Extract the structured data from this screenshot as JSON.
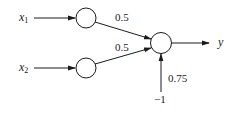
{
  "diagram": {
    "type": "perceptron",
    "inputs": [
      {
        "id": "x1",
        "label": "x",
        "subscript": "1"
      },
      {
        "id": "x2",
        "label": "x",
        "subscript": "2"
      }
    ],
    "weights": [
      {
        "from": "x1",
        "to": "output",
        "value": "0.5"
      },
      {
        "from": "x2",
        "to": "output",
        "value": "0.5"
      }
    ],
    "bias": {
      "input_value": "−1",
      "weight": "0.75"
    },
    "output": {
      "label": "y"
    },
    "colors": {
      "stroke": "#1a1a1a",
      "background": "#ffffff"
    }
  }
}
